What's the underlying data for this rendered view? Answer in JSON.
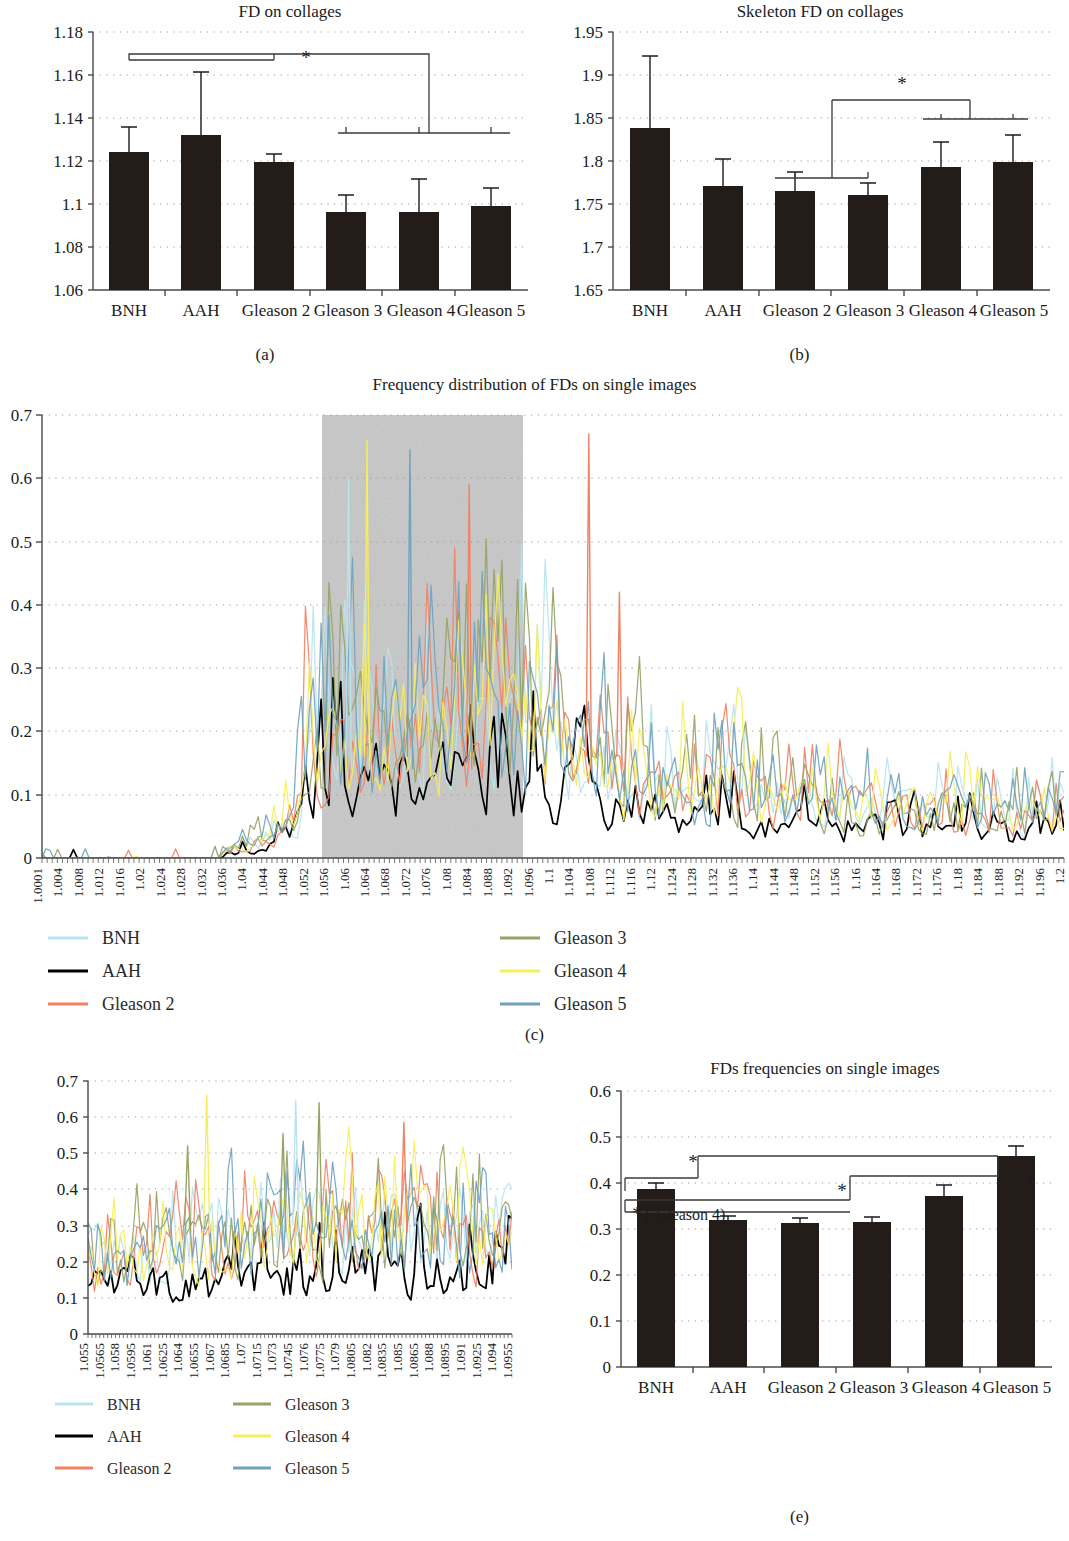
{
  "figure": {
    "captions": {
      "a": "(a)",
      "b": "(b)",
      "c": "(c)",
      "d": "(d)",
      "e": "(e)"
    }
  },
  "groups": [
    "BNH",
    "AAH",
    "Gleason 2",
    "Gleason 3",
    "Gleason 4",
    "Gleason 5"
  ],
  "series_colors": {
    "BNH": "#b7e4ef",
    "AAH": "#000000",
    "Gleason 2": "#f08264",
    "Gleason 3": "#97a364",
    "Gleason 4": "#f6ee5a",
    "Gleason 5": "#6fa3bd"
  },
  "panel_a": {
    "caption": "(a)",
    "chart_data": {
      "type": "bar",
      "title": "FD on collages",
      "xlabel": "",
      "ylabel": "",
      "categories": [
        "BNH",
        "AAH",
        "Gleason 2",
        "Gleason 3",
        "Gleason 4",
        "Gleason 5"
      ],
      "values": [
        1.124,
        1.132,
        1.1195,
        1.0967,
        1.0967,
        1.0993
      ],
      "errors": [
        0.0115,
        0.0295,
        0.0035,
        0.008,
        0.0155,
        0.0085
      ],
      "ylim": [
        1.06,
        1.18
      ],
      "yticks": [
        1.06,
        1.08,
        1.1,
        1.12,
        1.14,
        1.16,
        1.18
      ],
      "ytick_labels": [
        "1.06",
        "1.08",
        "1.1",
        "1.12",
        "1.14",
        "1.16",
        "1.18"
      ],
      "grid": true,
      "legend": "none",
      "annotations": [
        {
          "text": "*",
          "compares": [
            "BNH",
            "AAH",
            "Gleason 2"
          ],
          "against": [
            "Gleason 3",
            "Gleason 4",
            "Gleason 5"
          ]
        }
      ]
    }
  },
  "panel_b": {
    "caption": "(b)",
    "chart_data": {
      "type": "bar",
      "title": "Skeleton FD on collages",
      "xlabel": "",
      "ylabel": "",
      "categories": [
        "BNH",
        "AAH",
        "Gleason 2",
        "Gleason 3",
        "Gleason 4",
        "Gleason 5"
      ],
      "values": [
        1.838,
        1.771,
        1.765,
        1.761,
        1.793,
        1.799
      ],
      "errors": [
        0.084,
        0.032,
        0.022,
        0.0145,
        0.0145,
        0.031
      ],
      "ylim": [
        1.65,
        1.95
      ],
      "yticks": [
        1.65,
        1.7,
        1.75,
        1.8,
        1.85,
        1.9,
        1.95
      ],
      "ytick_labels": [
        "1.65",
        "1.7",
        "1.75",
        "1.8",
        "1.85",
        "1.9",
        "1.95"
      ],
      "grid": true,
      "legend": "none",
      "annotations": [
        {
          "text": "*",
          "compares": [
            "Gleason 2",
            "Gleason 3"
          ],
          "against": [
            "Gleason 4",
            "Gleason 5"
          ]
        }
      ]
    }
  },
  "panel_c": {
    "caption": "(c)",
    "chart_data": {
      "type": "line",
      "title": "Frequency distribution of FDs on single images",
      "xlabel": "",
      "ylabel": "",
      "ylim": [
        0,
        0.7
      ],
      "yticks": [
        0,
        0.1,
        0.2,
        0.3,
        0.4,
        0.5,
        0.6,
        0.7
      ],
      "ytick_labels": [
        "0",
        "0.1",
        "0.2",
        "0.3",
        "0.4",
        "0.5",
        "0.6",
        "0.7"
      ],
      "xlim": [
        1.0001,
        1.2
      ],
      "xtick_labels": [
        "1.0001",
        "1.004",
        "1.008",
        "1.012",
        "1.016",
        "1.02",
        "1.024",
        "1.028",
        "1.032",
        "1.036",
        "1.04",
        "1.044",
        "1.048",
        "1.052",
        "1.056",
        "1.06",
        "1.064",
        "1.068",
        "1.072",
        "1.076",
        "1.08",
        "1.084",
        "1.088",
        "1.092",
        "1.096",
        "1.1",
        "1.104",
        "1.108",
        "1.112",
        "1.116",
        "1.12",
        "1.124",
        "1.128",
        "1.132",
        "1.136",
        "1.14",
        "1.144",
        "1.148",
        "1.152",
        "1.156",
        "1.16",
        "1.164",
        "1.168",
        "1.172",
        "1.176",
        "1.18",
        "1.184",
        "1.188",
        "1.192",
        "1.196",
        "1.2"
      ],
      "grid": true,
      "legend_position": "bottom",
      "highlight_band": {
        "from": "1.052",
        "to": "1.096",
        "color": "#c6c6c6"
      },
      "series": [
        {
          "name": "BNH",
          "color": "#b7e4ef"
        },
        {
          "name": "AAH",
          "color": "#000000"
        },
        {
          "name": "Gleason 2",
          "color": "#f08264"
        },
        {
          "name": "Gleason 3",
          "color": "#97a364"
        },
        {
          "name": "Gleason 4",
          "color": "#f6ee5a"
        },
        {
          "name": "Gleason 5",
          "color": "#6fa3bd"
        }
      ]
    },
    "legend": [
      {
        "label": "BNH",
        "color": "#b7e4ef"
      },
      {
        "label": "AAH",
        "color": "#000000"
      },
      {
        "label": "Gleason 2",
        "color": "#f08264"
      },
      {
        "label": "Gleason 3",
        "color": "#97a364"
      },
      {
        "label": "Gleason 4",
        "color": "#f6ee5a"
      },
      {
        "label": "Gleason 5",
        "color": "#6fa3bd"
      }
    ]
  },
  "panel_d": {
    "caption": "(d)",
    "chart_data": {
      "type": "line",
      "title": "",
      "xlabel": "",
      "ylabel": "",
      "ylim": [
        0,
        0.7
      ],
      "yticks": [
        0,
        0.1,
        0.2,
        0.3,
        0.4,
        0.5,
        0.6,
        0.7
      ],
      "ytick_labels": [
        "0",
        "0.1",
        "0.2",
        "0.3",
        "0.4",
        "0.5",
        "0.6",
        "0.7"
      ],
      "xtick_labels": [
        "1.055",
        "1.0565",
        "1.058",
        "1.0595",
        "1.061",
        "1.0625",
        "1.064",
        "1.0655",
        "1.067",
        "1.0685",
        "1.07",
        "1.0715",
        "1.073",
        "1.0745",
        "1.076",
        "1.0775",
        "1.079",
        "1.0805",
        "1.082",
        "1.0835",
        "1.085",
        "1.0865",
        "1.088",
        "1.0895",
        "1.091",
        "1.0925",
        "1.094",
        "1.0955"
      ],
      "grid": true,
      "legend_position": "bottom",
      "series": [
        {
          "name": "BNH",
          "color": "#b7e4ef"
        },
        {
          "name": "AAH",
          "color": "#000000"
        },
        {
          "name": "Gleason 2",
          "color": "#f08264"
        },
        {
          "name": "Gleason 3",
          "color": "#97a364"
        },
        {
          "name": "Gleason 4",
          "color": "#f6ee5a"
        },
        {
          "name": "Gleason 5",
          "color": "#6fa3bd"
        }
      ]
    },
    "legend": [
      {
        "label": "BNH",
        "color": "#b7e4ef"
      },
      {
        "label": "AAH",
        "color": "#000000"
      },
      {
        "label": "Gleason 2",
        "color": "#f08264"
      },
      {
        "label": "Gleason 3",
        "color": "#97a364"
      },
      {
        "label": "Gleason 4",
        "color": "#f6ee5a"
      },
      {
        "label": "Gleason 5",
        "color": "#6fa3bd"
      }
    ]
  },
  "panel_e": {
    "caption": "(e)",
    "chart_data": {
      "type": "bar",
      "title": "FDs frequencies on single images",
      "xlabel": "",
      "ylabel": "",
      "categories": [
        "BNH",
        "AAH",
        "Gleason 2",
        "Gleason 3",
        "Gleason 4",
        "Gleason 5"
      ],
      "values": [
        0.388,
        0.321,
        0.313,
        0.315,
        0.371,
        0.458
      ],
      "errors": [
        0.006,
        0.009,
        0.011,
        0.012,
        0.022,
        0.021
      ],
      "ylim": [
        0,
        0.6
      ],
      "yticks": [
        0,
        0.1,
        0.2,
        0.3,
        0.4,
        0.5,
        0.6
      ],
      "ytick_labels": [
        "0",
        "0.1",
        "0.2",
        "0.3",
        "0.4",
        "0.5",
        "0.6"
      ],
      "grid": true,
      "legend": "none",
      "annotations": [
        {
          "text": "*",
          "note": ""
        },
        {
          "text": "*",
          "note": "(-Gleason 4)"
        },
        {
          "text": "*",
          "note": ""
        },
        {
          "text": "*",
          "note": ""
        }
      ]
    },
    "sig_note": "(-Gleason 4)",
    "star": "*"
  }
}
